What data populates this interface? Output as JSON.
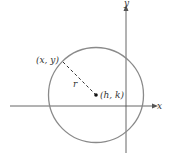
{
  "diagram": {
    "labels": {
      "point": "(x, y)",
      "radius": "r",
      "center": "(h, k)",
      "x_axis": "x",
      "y_axis": "y"
    },
    "colors": {
      "circle": "#8a8a8a",
      "axes": "#555555",
      "text": "#333333",
      "center_dot": "#111111"
    }
  }
}
